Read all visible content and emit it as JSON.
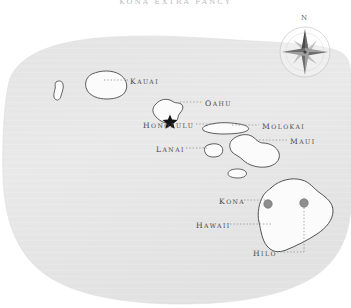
{
  "title": "KONA EXTRA FANCY",
  "compass": {
    "north_label": "N",
    "icon": "compass-rose-icon"
  },
  "colors": {
    "ocean": "#e8e8e8",
    "ocean_edge": "#dcdcdc",
    "island_fill": "#fbfbfb",
    "island_stroke": "#4a4a4a",
    "label_text": "#4a4a4a",
    "title_text": "#b9b9b9",
    "leader_line": "#8c8c8c",
    "city_marker": "#8e8e8e",
    "capital_marker": "#1a1a1a"
  },
  "labels": [
    {
      "id": "kauai",
      "text": "Kauai",
      "cap": "K",
      "rest": "AUAI",
      "x": 130,
      "y": 82,
      "kind": "island"
    },
    {
      "id": "oahu",
      "text": "Oahu",
      "cap": "O",
      "rest": "AHU",
      "x": 205,
      "y": 104,
      "kind": "island"
    },
    {
      "id": "honolulu",
      "text": "Honolulu",
      "cap": "H",
      "rest": "ONOLULU",
      "x": 148,
      "y": 126,
      "kind": "city"
    },
    {
      "id": "molokai",
      "text": "Molokai",
      "cap": "M",
      "rest": "OLOKAI",
      "x": 262,
      "y": 127,
      "kind": "island"
    },
    {
      "id": "maui",
      "text": "Maui",
      "cap": "M",
      "rest": "AUI",
      "x": 290,
      "y": 142,
      "kind": "island"
    },
    {
      "id": "lanai",
      "text": "Lanai",
      "cap": "L",
      "rest": "ANAI",
      "x": 156,
      "y": 150,
      "kind": "island"
    },
    {
      "id": "kona",
      "text": "Kona",
      "cap": "K",
      "rest": "ONA",
      "x": 219,
      "y": 202,
      "kind": "city"
    },
    {
      "id": "hawaii",
      "text": "Hawaii",
      "cap": "H",
      "rest": "AWAII",
      "x": 196,
      "y": 226,
      "kind": "island"
    },
    {
      "id": "hilo",
      "text": "Hilo",
      "cap": "H",
      "rest": "ILO",
      "x": 253,
      "y": 254,
      "kind": "city"
    }
  ],
  "markers": [
    {
      "id": "honolulu-star",
      "type": "star",
      "x": 170,
      "y": 121
    },
    {
      "id": "kona-dot",
      "type": "circle",
      "x": 268,
      "y": 204
    },
    {
      "id": "hilo-dot",
      "type": "circle",
      "x": 304,
      "y": 203
    }
  ],
  "islands": [
    {
      "id": "niihau",
      "name": "Niihau"
    },
    {
      "id": "kauai",
      "name": "Kauai"
    },
    {
      "id": "oahu",
      "name": "Oahu"
    },
    {
      "id": "molokai",
      "name": "Molokai"
    },
    {
      "id": "lanai",
      "name": "Lanai"
    },
    {
      "id": "maui",
      "name": "Maui"
    },
    {
      "id": "kahoolawe",
      "name": "Kahoolawe"
    },
    {
      "id": "hawaii",
      "name": "Hawaii"
    }
  ]
}
